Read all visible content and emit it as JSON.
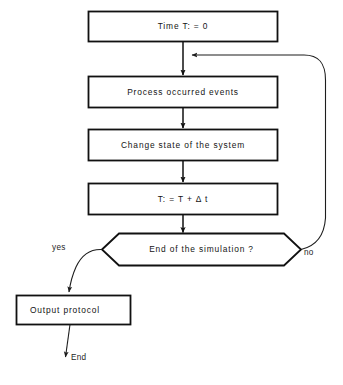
{
  "figure": {
    "kind": "flowchart",
    "background_color": "#ffffff",
    "stroke_color": "#111111",
    "text_color": "#141414"
  },
  "nodes": {
    "init": {
      "label": "Time  T: =  0",
      "shape": "process"
    },
    "process_events": {
      "label": "Process  occurred  events",
      "shape": "process"
    },
    "change_state": {
      "label": "Change  state  of  the  system",
      "shape": "process"
    },
    "advance_time": {
      "label": "T: =   T  +   Δ t",
      "shape": "process"
    },
    "decision": {
      "label": "End  of  the  simulation ?",
      "shape": "hexagon"
    },
    "output": {
      "label": "Output  protocol",
      "shape": "process"
    }
  },
  "edge_labels": {
    "yes": "yes",
    "no": "no",
    "end": "End"
  },
  "caption": {
    "text": ""
  }
}
